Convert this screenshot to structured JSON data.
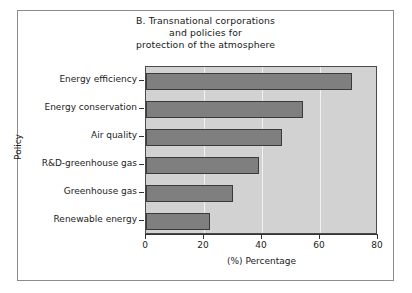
{
  "chart_data": {
    "type": "bar",
    "orientation": "horizontal",
    "title": "B. Transnational corporations and policies for protection of the atmosphere",
    "title_lines": [
      "B. Transnational corporations",
      "and policies for",
      "protection of the atmosphere"
    ],
    "categories": [
      "Energy efficiency",
      "Energy conservation",
      "Air quality",
      "R&D-greenhouse gas",
      "Greenhouse gas",
      "Renewable energy"
    ],
    "values": [
      71,
      54,
      47,
      39,
      30,
      22
    ],
    "xlabel": "(%) Percentage",
    "ylabel": "Policy",
    "xlim": [
      0,
      80
    ],
    "xticks": [
      0,
      20,
      40,
      60,
      80
    ],
    "xtick_labels": [
      "0",
      "20",
      "40",
      "60",
      "80"
    ],
    "grid": true,
    "grid_axis": "x",
    "legend": null,
    "colors": {
      "bar_fill": "#7f7f7f",
      "bar_edge": "#3a3a3a",
      "plot_background": "#d2d2d2",
      "gridline": "#f2f2f2",
      "figure_background": "#ffffff",
      "frame": "#8b8b8b",
      "axis": "#333333",
      "text": "#1c1c1c"
    }
  }
}
